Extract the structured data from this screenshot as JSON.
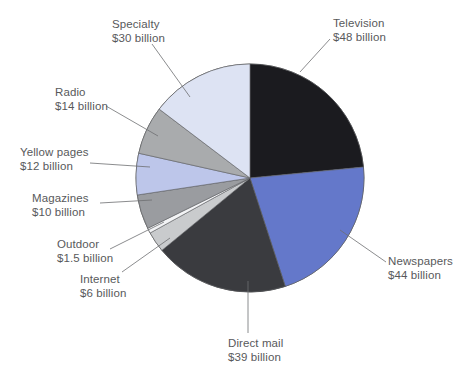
{
  "chart_data": {
    "type": "pie",
    "title": "",
    "unit": "billion US dollars",
    "total": 204.5,
    "categories": [
      "Television",
      "Newspapers",
      "Direct mail",
      "Internet",
      "Outdoor",
      "Magazines",
      "Yellow pages",
      "Radio",
      "Specialty"
    ],
    "values": [
      48,
      44,
      39,
      6,
      1.5,
      10,
      12,
      14,
      30
    ],
    "value_labels": [
      "$48 billion",
      "$44 billion",
      "$39 billion",
      "$6 billion",
      "$1.5 billion",
      "$10 billion",
      "$12 billion",
      "$14 billion",
      "$30 billion"
    ],
    "colors": [
      "#1b1b1f",
      "#6478ca",
      "#3a3b3f",
      "#c9cbcd",
      "#f2f3f5",
      "#9a9ca0",
      "#bdc6ea",
      "#a9abad",
      "#dde3f3"
    ],
    "start_angle_deg": 0,
    "direction": "clockwise",
    "legend": "none",
    "grid": false,
    "slices": [
      {
        "label": "Television",
        "value_label": "$48 billion",
        "value": 48,
        "color": "#1b1b1f",
        "label_pos": "right-top",
        "label_x": 333,
        "label_y": 17,
        "align": "left",
        "leader": [
          [
            330,
            39
          ],
          [
            300,
            72
          ]
        ]
      },
      {
        "label": "Newspapers",
        "value_label": "$44 billion",
        "value": 44,
        "color": "#6478ca",
        "label_pos": "right-bottom",
        "label_x": 388,
        "label_y": 255,
        "align": "left",
        "leader": [
          [
            386,
            262
          ],
          [
            340,
            230
          ]
        ]
      },
      {
        "label": "Direct mail",
        "value_label": "$39 billion",
        "value": 39,
        "color": "#3a3b3f",
        "label_pos": "bottom",
        "label_x": 228,
        "label_y": 337,
        "align": "left",
        "leader": [
          [
            248,
            333
          ],
          [
            248,
            281
          ]
        ]
      },
      {
        "label": "Internet",
        "value_label": "$6 billion",
        "value": 6,
        "color": "#c9cbcd",
        "label_pos": "left-bottom",
        "label_x": 80,
        "label_y": 273,
        "align": "left",
        "leader": [
          [
            122,
            272
          ],
          [
            170,
            238
          ]
        ]
      },
      {
        "label": "Outdoor",
        "value_label": "$1.5 billion",
        "value": 1.5,
        "color": "#f2f3f5",
        "label_pos": "left-bottom",
        "label_x": 57,
        "label_y": 238,
        "align": "left",
        "leader": [
          [
            110,
            249
          ],
          [
            164,
            222
          ]
        ]
      },
      {
        "label": "Magazines",
        "value_label": "$10 billion",
        "value": 10,
        "color": "#9a9ca0",
        "label_pos": "left",
        "label_x": 32,
        "label_y": 192,
        "align": "left",
        "leader": [
          [
            100,
            203
          ],
          [
            152,
            200
          ]
        ]
      },
      {
        "label": "Yellow pages",
        "value_label": "$12 billion",
        "value": 12,
        "color": "#bdc6ea",
        "label_pos": "left",
        "label_x": 20,
        "label_y": 146,
        "align": "left",
        "leader": [
          [
            90,
            163
          ],
          [
            150,
            167
          ]
        ]
      },
      {
        "label": "Radio",
        "value_label": "$14 billion",
        "value": 14,
        "color": "#a9abad",
        "label_pos": "left-top",
        "label_x": 55,
        "label_y": 86,
        "align": "left",
        "leader": [
          [
            106,
            106
          ],
          [
            158,
            136
          ]
        ]
      },
      {
        "label": "Specialty",
        "value_label": "$30 billion",
        "value": 30,
        "color": "#dde3f3",
        "label_pos": "top",
        "label_x": 112,
        "label_y": 18,
        "align": "left",
        "leader": [
          [
            152,
            44
          ],
          [
            190,
            97
          ]
        ]
      }
    ],
    "center": {
      "x": 250,
      "y": 178
    },
    "radius": 114,
    "text_color": "#58595b"
  }
}
